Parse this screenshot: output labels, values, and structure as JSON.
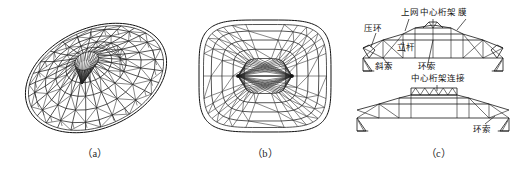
{
  "figure": {
    "type": "technical-diagram",
    "background_color": "#ffffff",
    "line_color": "#1a1a1a"
  },
  "panels": [
    {
      "id": "a",
      "caption": "（a）",
      "view": "perspective-oblique",
      "description": "tilted elliptical cable dome triangulated mesh"
    },
    {
      "id": "b",
      "caption": "（b）",
      "view": "plan",
      "description": "rounded rectangular plan with two radial hub nodes"
    },
    {
      "id": "c",
      "caption": "（c）",
      "view": "sections",
      "description": "longitudinal and transverse sections with component callouts"
    }
  ],
  "section_labels": {
    "compression_ring": "压环",
    "upper_net": "上网",
    "center_truss": "中心桁架",
    "membrane": "膜",
    "strut": "立杆",
    "diagonal_cable": "斜索",
    "ring_cable": "环索",
    "center_truss_connection": "中心桁架连接",
    "ring_cable_lower": "环索"
  }
}
